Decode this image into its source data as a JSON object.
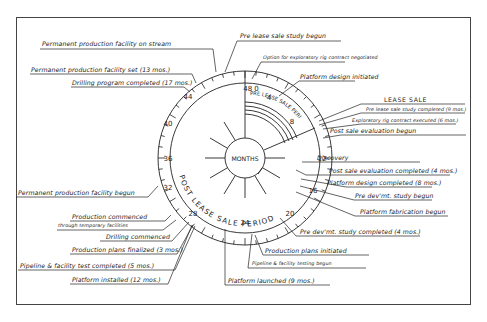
{
  "diagram": {
    "center_label": "MONTHS",
    "arc_labels": {
      "pre": "PRE LEASE SALE PERIOD",
      "post": "POST LEASE SALE PERIOD"
    },
    "dial_ticks": [
      "48 0",
      "4",
      "8",
      "12",
      "16",
      "20",
      "24",
      "28",
      "32",
      "36",
      "40",
      "44"
    ],
    "tick_values": {
      "t0": "48",
      "t0b": "0",
      "t4": "4",
      "t8": "8",
      "t12": "12",
      "t16": "16",
      "t20": "20",
      "t24": "24",
      "t28": "28",
      "t32": "32",
      "t36": "36",
      "t40": "40",
      "t44": "44"
    },
    "events": [
      {
        "id": "e1",
        "text": "Permanent production facility on stream"
      },
      {
        "id": "e2",
        "text": "Pre lease sale study begun"
      },
      {
        "id": "e3",
        "text": "Option for exploratory rig contract negotiated"
      },
      {
        "id": "e4",
        "text": "Platform design initiated"
      },
      {
        "id": "e5",
        "text": "Permanent production facility set (13 mos.)"
      },
      {
        "id": "e6",
        "text": "Drilling program completed (17 mos.)"
      },
      {
        "id": "e7",
        "text": "LEASE SALE"
      },
      {
        "id": "e8",
        "text": "Pre lease sale study completed (9 mos.)"
      },
      {
        "id": "e9",
        "text": "Exploratory rig contract executed (6 mos.)"
      },
      {
        "id": "e10",
        "text": "Post sale evaluation begun"
      },
      {
        "id": "e11",
        "text": "Discovery"
      },
      {
        "id": "e12",
        "text": "Post sale evaluation completed (4 mos.)"
      },
      {
        "id": "e13",
        "text": "Platform design completed (8 mos.)"
      },
      {
        "id": "e14",
        "text": "Pre dev'mt. study begun"
      },
      {
        "id": "e15",
        "text": "Platform fabrication begun"
      },
      {
        "id": "e16",
        "text": "Permanent production facility begun"
      },
      {
        "id": "e17",
        "text": "Production commenced"
      },
      {
        "id": "e18",
        "text": "through temporary facilities"
      },
      {
        "id": "e19",
        "text": "Drilling commenced"
      },
      {
        "id": "e20",
        "text": "Production plans finalized (3 mos.)"
      },
      {
        "id": "e21",
        "text": "Pipeline & facility test completed (5 mos.)"
      },
      {
        "id": "e22",
        "text": "Platform installed (12 mos.)"
      },
      {
        "id": "e23",
        "text": "Pre dev'mt. study completed (4 mos.)"
      },
      {
        "id": "e24",
        "text": "Production plans initiated"
      },
      {
        "id": "e25",
        "text": "Pipeline & facility testing begun"
      },
      {
        "id": "e26",
        "text": "Platform launched (9 mos.)"
      }
    ],
    "ev": {
      "e1": "Permanent production facility on stream",
      "e2": "Pre lease sale study begun",
      "e3": "Option for exploratory rig contract negotiated",
      "e4": "Platform design initiated",
      "e5": "Permanent production facility set (13 mos.)",
      "e6": "Drilling program completed (17 mos.)",
      "e7": "LEASE SALE",
      "e8": "Pre lease sale study completed (9 mos.)",
      "e9": "Exploratory rig contract executed (6 mos.)",
      "e10": "Post sale evaluation begun",
      "e11": "Discovery",
      "e12": "Post sale evaluation completed (4 mos.)",
      "e13": "Platform design completed (8 mos.)",
      "e14": "Pre dev'mt. study begun",
      "e15": "Platform fabrication begun",
      "e16": "Permanent production facility begun",
      "e17": "Production commenced",
      "e18": "through temporary facilities",
      "e19": "Drilling commenced",
      "e20": "Production plans finalized (3 mos.)",
      "e21": "Pipeline & facility test completed (5 mos.)",
      "e22": "Platform installed (12 mos.)",
      "e23": "Pre dev'mt. study completed (4 mos.)",
      "e24": "Production plans initiated",
      "e25": "Pipeline & facility testing begun",
      "e26": "Platform launched (9 mos.)"
    },
    "colors": {
      "ink": "#222222",
      "paper": "#ffffff",
      "frame": "#444444"
    }
  }
}
